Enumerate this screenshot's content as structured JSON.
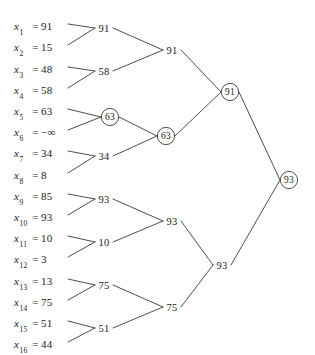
{
  "figure": {
    "type": "tournament-selection-tree",
    "background_color": "#ffffff",
    "line_color": "#3a3a3a",
    "text_color": "#1a1a1a",
    "width": 315,
    "height": 355
  },
  "leaves": [
    {
      "name": "x",
      "subscript": "1",
      "eq": "=",
      "value": "91",
      "x": 14,
      "y": 28,
      "anchor_x": 68
    },
    {
      "name": "x",
      "subscript": "2",
      "eq": "=",
      "value": "15",
      "x": 14,
      "y": 49,
      "anchor_x": 68
    },
    {
      "name": "x",
      "subscript": "3",
      "eq": "=",
      "value": "48",
      "x": 14,
      "y": 71,
      "anchor_x": 68
    },
    {
      "name": "x",
      "subscript": "4",
      "eq": "=",
      "value": "58",
      "x": 14,
      "y": 92,
      "anchor_x": 68
    },
    {
      "name": "x",
      "subscript": "5",
      "eq": "=",
      "value": "63",
      "x": 14,
      "y": 113,
      "anchor_x": 68
    },
    {
      "name": "x",
      "subscript": "6",
      "eq": "=",
      "value": "−∞",
      "x": 14,
      "y": 134,
      "anchor_x": 68
    },
    {
      "name": "x",
      "subscript": "7",
      "eq": "=",
      "value": "34",
      "x": 14,
      "y": 155,
      "anchor_x": 68
    },
    {
      "name": "x",
      "subscript": "8",
      "eq": "=",
      "value": "8",
      "x": 14,
      "y": 177,
      "anchor_x": 68
    },
    {
      "name": "x",
      "subscript": "9",
      "eq": "=",
      "value": "85",
      "x": 14,
      "y": 198,
      "anchor_x": 68
    },
    {
      "name": "x",
      "subscript": "10",
      "eq": "=",
      "value": "93",
      "x": 14,
      "y": 219,
      "anchor_x": 68
    },
    {
      "name": "x",
      "subscript": "11",
      "eq": "=",
      "value": "10",
      "x": 14,
      "y": 240,
      "anchor_x": 68
    },
    {
      "name": "x",
      "subscript": "12",
      "eq": "=",
      "value": "3",
      "x": 14,
      "y": 261,
      "anchor_x": 68
    },
    {
      "name": "x",
      "subscript": "13",
      "eq": "=",
      "value": "13",
      "x": 14,
      "y": 283,
      "anchor_x": 68
    },
    {
      "name": "x",
      "subscript": "14",
      "eq": "=",
      "value": "75",
      "x": 14,
      "y": 304,
      "anchor_x": 68
    },
    {
      "name": "x",
      "subscript": "15",
      "eq": "=",
      "value": "51",
      "x": 14,
      "y": 325,
      "anchor_x": 68
    },
    {
      "name": "x",
      "subscript": "16",
      "eq": "=",
      "value": "44",
      "x": 14,
      "y": 346,
      "anchor_x": 68
    }
  ],
  "internal_nodes": [
    {
      "id": "L2-1",
      "label": "91",
      "x": 104,
      "y": 28,
      "circled": false,
      "children": [
        0,
        1
      ]
    },
    {
      "id": "L2-2",
      "label": "58",
      "x": 104,
      "y": 71,
      "circled": false,
      "children": [
        2,
        3
      ]
    },
    {
      "id": "L2-3",
      "label": "63",
      "x": 110,
      "y": 117,
      "circled": true,
      "children": [
        4,
        5
      ]
    },
    {
      "id": "L2-4",
      "label": "34",
      "x": 104,
      "y": 156,
      "circled": false,
      "children": [
        6,
        7
      ]
    },
    {
      "id": "L2-5",
      "label": "93",
      "x": 104,
      "y": 199,
      "circled": false,
      "children": [
        8,
        9
      ]
    },
    {
      "id": "L2-6",
      "label": "10",
      "x": 104,
      "y": 242,
      "circled": false,
      "children": [
        10,
        11
      ]
    },
    {
      "id": "L2-7",
      "label": "75",
      "x": 104,
      "y": 285,
      "circled": false,
      "children": [
        12,
        13
      ]
    },
    {
      "id": "L2-8",
      "label": "51",
      "x": 104,
      "y": 328,
      "circled": false,
      "children": [
        14,
        15
      ]
    },
    {
      "id": "L3-1",
      "label": "91",
      "x": 172,
      "y": 50,
      "circled": false,
      "children": [
        "L2-1",
        "L2-2"
      ]
    },
    {
      "id": "L3-2",
      "label": "63",
      "x": 166,
      "y": 136,
      "circled": true,
      "children": [
        "L2-3",
        "L2-4"
      ]
    },
    {
      "id": "L3-3",
      "label": "93",
      "x": 172,
      "y": 221,
      "circled": false,
      "children": [
        "L2-5",
        "L2-6"
      ]
    },
    {
      "id": "L3-4",
      "label": "75",
      "x": 172,
      "y": 307,
      "circled": false,
      "children": [
        "L2-7",
        "L2-8"
      ]
    },
    {
      "id": "L4-1",
      "label": "91",
      "x": 230,
      "y": 92,
      "circled": true,
      "children": [
        "L3-1",
        "L3-2"
      ]
    },
    {
      "id": "L4-2",
      "label": "93",
      "x": 222,
      "y": 265,
      "circled": false,
      "children": [
        "L3-3",
        "L3-4"
      ]
    },
    {
      "id": "L5-1",
      "label": "93",
      "x": 289,
      "y": 180,
      "circled": true,
      "children": [
        "L4-1",
        "L4-2"
      ]
    }
  ]
}
